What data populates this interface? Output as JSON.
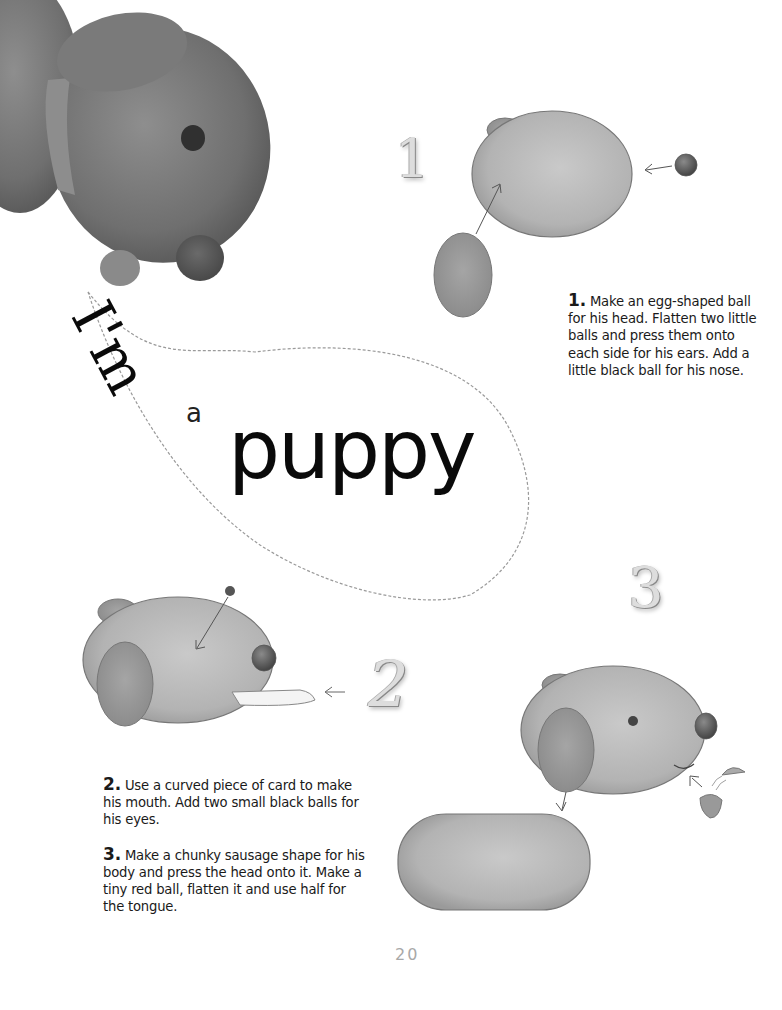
{
  "title": {
    "line1": "I'm",
    "article": "a",
    "word": "puppy"
  },
  "steps": [
    {
      "number": "1",
      "numeral_label": "1.",
      "text": "Make an egg-shaped ball for his head. Flatten two little balls and press them onto each side for his ears. Add a little black ball for his nose."
    },
    {
      "number": "2",
      "numeral_label": "2.",
      "text": "Use a curved piece of card to make his mouth. Add two small black balls for his eyes."
    },
    {
      "number": "3",
      "numeral_label": "3.",
      "text": "Make a chunky sausage shape for his body and press the head onto it. Make a tiny red ball, flatten it and use half for the tongue."
    }
  ],
  "page_number": "20",
  "illustrations": {
    "photo": "clay-puppy-photo",
    "step1": "egg-head-with-ear-and-nose",
    "step2": "head-with-ear-card-mouth-eye",
    "step3": "head-body-tongue-assembly"
  }
}
